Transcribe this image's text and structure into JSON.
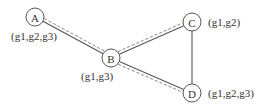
{
  "diagram": {
    "type": "graph",
    "width": 262,
    "height": 109,
    "node_radius": 9,
    "nodes": [
      {
        "id": "A",
        "label": "A",
        "x": 35,
        "y": 17,
        "annotation": "(g1,g2,g3)",
        "ann_x": 11,
        "ann_y": 40,
        "ann_anchor": "start"
      },
      {
        "id": "B",
        "label": "B",
        "x": 111,
        "y": 58,
        "annotation": "(g1,g3)",
        "ann_x": 81,
        "ann_y": 80,
        "ann_anchor": "start"
      },
      {
        "id": "C",
        "label": "C",
        "x": 192,
        "y": 22,
        "annotation": "(g1,g2)",
        "ann_x": 208,
        "ann_y": 26,
        "ann_anchor": "start"
      },
      {
        "id": "D",
        "label": "D",
        "x": 192,
        "y": 93,
        "annotation": "(g1,g2,g3)",
        "ann_x": 208,
        "ann_y": 97,
        "ann_anchor": "start"
      }
    ],
    "edges": [
      {
        "from": "A",
        "to": "B",
        "style": "solid",
        "offset": 0
      },
      {
        "from": "A",
        "to": "B",
        "style": "dashed",
        "offset": -3
      },
      {
        "from": "B",
        "to": "C",
        "style": "solid",
        "offset": 0
      },
      {
        "from": "B",
        "to": "C",
        "style": "dashed",
        "offset": -3
      },
      {
        "from": "B",
        "to": "D",
        "style": "solid",
        "offset": 0
      },
      {
        "from": "B",
        "to": "D",
        "style": "dashed",
        "offset": 3
      },
      {
        "from": "C",
        "to": "D",
        "style": "solid",
        "offset": 0
      }
    ],
    "colors": {
      "stroke": "#555555",
      "dashed": "#777777",
      "text": "#333333",
      "background": "#ffffff"
    }
  }
}
